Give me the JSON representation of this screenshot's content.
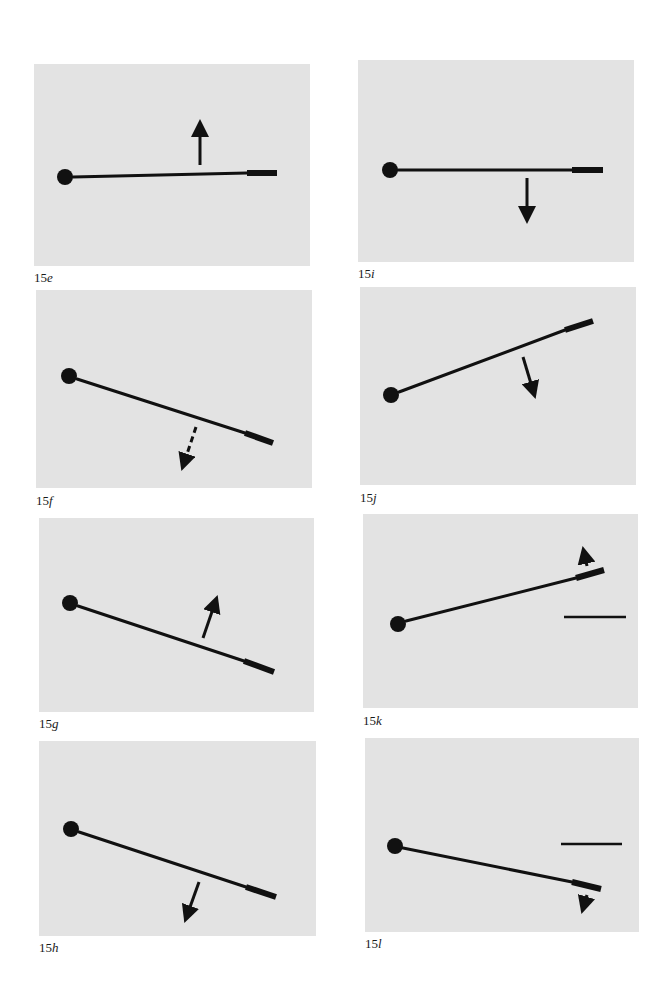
{
  "figure": {
    "colors": {
      "background": "#ffffff",
      "panel": "#e3e3e3",
      "ink": "#111111"
    },
    "panels": [
      {
        "id": "15e",
        "number": "15",
        "letter": "e",
        "box": [
          34,
          64,
          276,
          202
        ],
        "label_pos": [
          34,
          282
        ],
        "ball": [
          65,
          177,
          8
        ],
        "rod": [
          73,
          177,
          247,
          173
        ],
        "tip": [
          247,
          173,
          277,
          173
        ],
        "arrow": {
          "from": [
            200,
            165
          ],
          "to": [
            200,
            121
          ],
          "style": "solid",
          "direction": "up"
        }
      },
      {
        "id": "15i",
        "number": "15",
        "letter": "i",
        "box": [
          358,
          60,
          276,
          202
        ],
        "label_pos": [
          358,
          278
        ],
        "ball": [
          390,
          170,
          8
        ],
        "rod": [
          398,
          170,
          572,
          170
        ],
        "tip": [
          572,
          170,
          603,
          170
        ],
        "arrow": {
          "from": [
            527,
            178
          ],
          "to": [
            527,
            222
          ],
          "style": "solid",
          "direction": "down"
        }
      },
      {
        "id": "15f",
        "number": "15",
        "letter": "f",
        "box": [
          36,
          290,
          276,
          198
        ],
        "label_pos": [
          36,
          505
        ],
        "ball": [
          69,
          376,
          8
        ],
        "rod": [
          77,
          379,
          245,
          433
        ],
        "tip": [
          245,
          433,
          273,
          443
        ],
        "arrow": {
          "from": [
            196,
            427
          ],
          "to": [
            182,
            469
          ],
          "style": "dashed",
          "direction": "down-left"
        }
      },
      {
        "id": "15j",
        "number": "15",
        "letter": "j",
        "box": [
          360,
          287,
          276,
          198
        ],
        "label_pos": [
          360,
          502
        ],
        "ball": [
          391,
          395,
          8
        ],
        "rod": [
          399,
          392,
          565,
          330
        ],
        "tip": [
          565,
          330,
          593,
          321
        ],
        "arrow": {
          "from": [
            523,
            357
          ],
          "to": [
            535,
            397
          ],
          "style": "solid",
          "direction": "down-right"
        }
      },
      {
        "id": "15g",
        "number": "15",
        "letter": "g",
        "box": [
          39,
          518,
          275,
          194
        ],
        "label_pos": [
          39,
          728
        ],
        "ball": [
          70,
          603,
          8
        ],
        "rod": [
          78,
          606,
          244,
          661
        ],
        "tip": [
          244,
          661,
          274,
          672
        ],
        "arrow": {
          "from": [
            203,
            638
          ],
          "to": [
            217,
            597
          ],
          "style": "solid",
          "direction": "up-right"
        }
      },
      {
        "id": "15k",
        "number": "15",
        "letter": "k",
        "box": [
          363,
          514,
          275,
          194
        ],
        "label_pos": [
          363,
          725
        ],
        "ball": [
          398,
          624,
          8
        ],
        "rod": [
          406,
          621,
          576,
          578
        ],
        "tip": [
          576,
          578,
          604,
          570
        ],
        "arrow": {
          "from": [
            587,
            566
          ],
          "to": [
            583,
            548
          ],
          "style": "solid",
          "direction": "up"
        },
        "reference_line": [
          564,
          617,
          626,
          617
        ]
      },
      {
        "id": "15h",
        "number": "15",
        "letter": "h",
        "box": [
          39,
          741,
          277,
          195
        ],
        "label_pos": [
          39,
          952
        ],
        "ball": [
          71,
          829,
          8
        ],
        "rod": [
          79,
          832,
          246,
          887
        ],
        "tip": [
          246,
          887,
          276,
          897
        ],
        "arrow": {
          "from": [
            199,
            882
          ],
          "to": [
            185,
            921
          ],
          "style": "solid",
          "direction": "down-left"
        }
      },
      {
        "id": "15l",
        "number": "15",
        "letter": "l",
        "box": [
          365,
          738,
          274,
          194
        ],
        "label_pos": [
          365,
          948
        ],
        "ball": [
          395,
          846,
          8
        ],
        "rod": [
          403,
          848,
          572,
          882
        ],
        "tip": [
          572,
          882,
          601,
          889
        ],
        "arrow": {
          "from": [
            587,
            895
          ],
          "to": [
            582,
            912
          ],
          "style": "solid",
          "direction": "down"
        },
        "reference_line": [
          561,
          844,
          622,
          844
        ]
      }
    ]
  }
}
